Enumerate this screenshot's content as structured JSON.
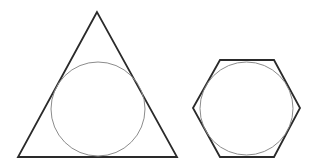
{
  "diagram": {
    "colors": {
      "background": "#ffffff",
      "polygon_stroke": "#2a2a2a",
      "circle_stroke": "#8c8c8c"
    },
    "shapes": [
      {
        "name": "triangle",
        "type": "polygon",
        "points": "97,12 18,157 177,157",
        "stroke_width": 1.8
      },
      {
        "name": "triangle-incircle",
        "type": "circle",
        "cx": 98,
        "cy": 109,
        "r": 47,
        "stroke_width": 1
      },
      {
        "name": "hexagon",
        "type": "polygon",
        "points": "193,108 220,60 274,60 300,108 274,157 220,157",
        "stroke_width": 1.8
      },
      {
        "name": "hexagon-incircle",
        "type": "circle",
        "cx": 246.5,
        "cy": 108.5,
        "r": 46.5,
        "stroke_width": 1
      }
    ]
  }
}
